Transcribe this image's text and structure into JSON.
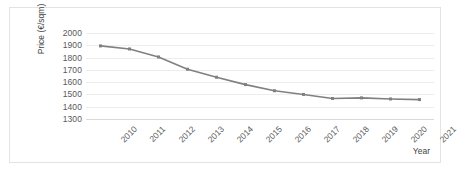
{
  "chart_data": {
    "type": "line",
    "title": "",
    "xlabel": "Year",
    "ylabel": "Price (€/sqm)",
    "categories": [
      "2010",
      "2011",
      "2012",
      "2013",
      "2014",
      "2015",
      "2016",
      "2017",
      "2018",
      "2019",
      "2020",
      "2021"
    ],
    "values": [
      1895,
      1870,
      1805,
      1705,
      1640,
      1580,
      1530,
      1500,
      1467,
      1472,
      1463,
      1458
    ],
    "series": [
      {
        "name": "Price",
        "values": [
          1895,
          1870,
          1805,
          1705,
          1640,
          1580,
          1530,
          1500,
          1467,
          1472,
          1463,
          1458
        ]
      }
    ],
    "ylim": [
      1300,
      2000
    ],
    "ytick_labels": [
      "2000",
      "1900",
      "1800",
      "1700",
      "1600",
      "1500",
      "1400",
      "1300"
    ],
    "ytick_values": [
      2000,
      1900,
      1800,
      1700,
      1600,
      1500,
      1400,
      1300
    ],
    "ystep": 100,
    "grid": true,
    "legend": "none",
    "marker": "square",
    "line_color": "#808080",
    "marker_color": "#808080",
    "grid_color": "#ededed",
    "axis_color": "#d9d9d9",
    "text_color": "#595959",
    "border_color": "#e3e3e3",
    "background": "#ffffff"
  }
}
